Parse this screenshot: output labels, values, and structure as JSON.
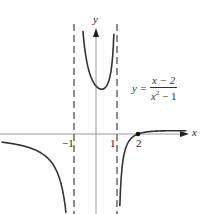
{
  "chart_data": {
    "type": "line",
    "title": "",
    "function": "y = (x - 2)/(x^2 - 1)",
    "equation_label": {
      "lhs": "y =",
      "numerator": "x − 2",
      "denominator_base": "x",
      "denominator_exp": "2",
      "denominator_rest": " − 1"
    },
    "xlabel": "x",
    "ylabel": "y",
    "x_ticks": [
      "−1",
      "1",
      "2"
    ],
    "vertical_asymptotes": [
      -1,
      1
    ],
    "horizontal_asymptote": 0,
    "marked_point": {
      "x": 2,
      "y": 0
    },
    "branches": [
      {
        "domain": [
          -4.5,
          -1.05
        ],
        "behavior": "approaches 0 from below as x→−∞, →−∞ as x→−1⁻"
      },
      {
        "domain": [
          -0.78,
          0.86
        ],
        "behavior": "U-shaped, minimum ≈ 1.87 near x≈0.27, →+∞ at both asymptotes"
      },
      {
        "domain": [
          1.02,
          4.3
        ],
        "behavior": "→−∞ as x→1⁺, crosses x-axis at x=2, approaches 0 from above"
      }
    ],
    "grid": false,
    "legend": null
  },
  "labels": {
    "x_axis": "x",
    "y_axis": "y",
    "tick_neg1": "−1",
    "tick_1": "1",
    "tick_2": "2",
    "eq_lhs": "y =",
    "eq_num": "x − 2",
    "eq_den_base": "x",
    "eq_den_exp": "2",
    "eq_den_rest": " − 1"
  }
}
